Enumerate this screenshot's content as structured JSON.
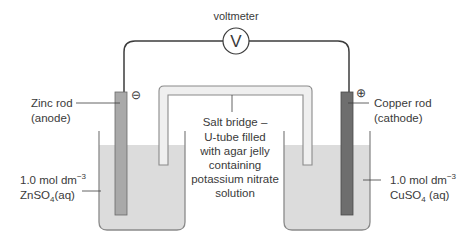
{
  "diagram": {
    "voltmeter": {
      "label": "voltmeter",
      "symbol": "V"
    },
    "left_half_cell": {
      "electrode_label_line1": "Zinc rod",
      "electrode_label_line2": "(anode)",
      "polarity": "⊖",
      "solution_conc": "1.0 mol dm",
      "solution_conc_exp": "−3",
      "solution_formula_a": "ZnSO",
      "solution_formula_sub": "4",
      "solution_formula_b": "(aq)"
    },
    "right_half_cell": {
      "electrode_label_line1": "Copper rod",
      "electrode_label_line2": "(cathode)",
      "polarity": "⊕",
      "solution_conc": "1.0 mol dm",
      "solution_conc_exp": "−3",
      "solution_formula_a": "CuSO",
      "solution_formula_sub": "4",
      "solution_formula_b": " (aq)"
    },
    "salt_bridge": {
      "lines": [
        "Salt bridge –",
        "U-tube filled",
        "with agar jelly",
        "containing",
        "potassium nitrate",
        "solution"
      ]
    },
    "colors": {
      "wire": "#3c3c3c",
      "solution": "#dcdcdc",
      "beaker_outline": "#8a8a8a",
      "zinc_rod": "#a9a9a9",
      "copper_rod": "#6e6e6e",
      "salt_bridge_fill": "#efefef",
      "text": "#3a3a3a"
    }
  }
}
